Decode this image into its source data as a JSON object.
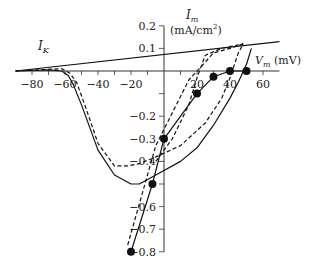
{
  "chart_data": {
    "type": "line",
    "title": "",
    "xlabel": "V_m (mV)",
    "ylabel": "I_m (mA/cm²)",
    "xlim": [
      -90,
      70
    ],
    "ylim": [
      -0.8,
      0.2
    ],
    "x_ticks": [
      -80,
      -60,
      -40,
      -20,
      20,
      40,
      60
    ],
    "x_tick_labels": [
      "-80",
      "-60",
      "-40",
      "-20",
      "20",
      "40",
      "60"
    ],
    "y_ticks": [
      0.2,
      0.1,
      -0.2,
      -0.3,
      -0.4,
      -0.5,
      -0.6,
      -0.7,
      -0.8
    ],
    "y_tick_labels": [
      "0.2",
      "0.1",
      "-0.2",
      "-0.3",
      "-0.4",
      "",
      "-0.6",
      "-0.7",
      "-0.8"
    ],
    "grid": false,
    "annotations": [
      "I_K"
    ],
    "series": [
      {
        "name": "I_K",
        "style": "solid",
        "x": [
          -90,
          70
        ],
        "y": [
          0.0,
          0.13
        ]
      },
      {
        "name": "I_m solid (loop)",
        "style": "solid",
        "x": [
          -90,
          -70,
          -62,
          -58,
          -55,
          -50,
          -40,
          -30,
          -20,
          -15,
          -5,
          10,
          20,
          30,
          40,
          45,
          50,
          53
        ],
        "y": [
          0.0,
          0.005,
          0.0,
          -0.02,
          -0.06,
          -0.15,
          -0.35,
          -0.46,
          -0.5,
          -0.5,
          -0.46,
          -0.4,
          -0.34,
          -0.24,
          -0.12,
          -0.05,
          0.03,
          0.1
        ]
      },
      {
        "name": "I_m dashed (loop)",
        "style": "dashed",
        "x": [
          -90,
          -62,
          -57,
          -53,
          -48,
          -40,
          -30,
          -22,
          -15,
          -5,
          10,
          25,
          35,
          40,
          45,
          48
        ],
        "y": [
          0.0,
          0.01,
          -0.01,
          -0.05,
          -0.15,
          -0.32,
          -0.42,
          -0.42,
          -0.41,
          -0.38,
          -0.33,
          -0.23,
          -0.12,
          -0.03,
          0.08,
          0.12
        ]
      },
      {
        "name": "Peak current (points)",
        "style": "solid-markers",
        "x": [
          -20,
          -7,
          0,
          20,
          30,
          40,
          50
        ],
        "y": [
          -0.8,
          -0.5,
          -0.3,
          -0.1,
          -0.025,
          0.0,
          0.0
        ]
      },
      {
        "name": "Peak current dashed",
        "style": "dashed",
        "x": [
          -22,
          -5,
          15,
          25,
          30,
          40,
          48
        ],
        "y": [
          -0.77,
          -0.33,
          -0.04,
          0.04,
          0.08,
          0.1,
          0.12
        ]
      },
      {
        "name": "Upper dashed branch",
        "style": "dashed",
        "x": [
          -5,
          5,
          15,
          20,
          25,
          35,
          48
        ],
        "y": [
          -0.4,
          -0.3,
          -0.15,
          -0.03,
          0.07,
          0.1,
          0.12
        ]
      }
    ]
  },
  "labels": {
    "ik": "I",
    "ik_sub": "K",
    "im": "I",
    "im_sub": "m",
    "im_units": "(mA/cm",
    "im_units_sup": "2",
    "im_units_end": ")",
    "vm": "V",
    "vm_sub": "m",
    "vm_units": " (mV)"
  }
}
